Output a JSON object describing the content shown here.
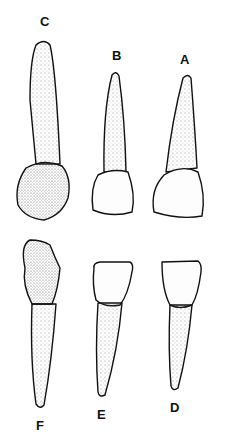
{
  "figure": {
    "labels": {
      "A": "A",
      "B": "B",
      "C": "C",
      "D": "D",
      "E": "E",
      "F": "F"
    },
    "colors": {
      "outline": "#111111",
      "stipple": "#777777",
      "background": "#ffffff"
    }
  }
}
